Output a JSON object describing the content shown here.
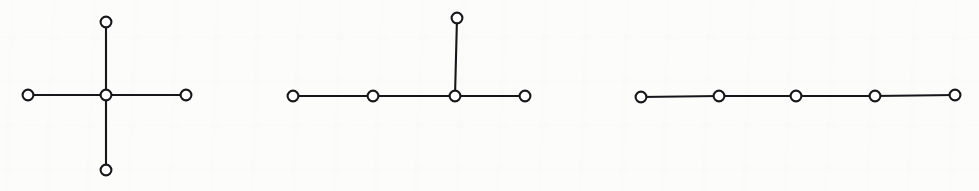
{
  "figure": {
    "name": "graph-figure-row",
    "width": 979,
    "height": 191,
    "background_color": "#fcfcfb",
    "ink_color": "#18161a",
    "node_fill_color": "#ffffff",
    "node_radius": 5.4,
    "node_stroke_width": 2.1,
    "edge_stroke_width": 2.1,
    "caption": "",
    "labels": []
  },
  "graphs": [
    {
      "name": "star-graph",
      "label": "",
      "node_count": 5,
      "edge_count": 4,
      "nodes": [
        {
          "id": "g1n0",
          "label": "",
          "x": 106,
          "y": 95
        },
        {
          "id": "g1n1",
          "label": "",
          "x": 28,
          "y": 95
        },
        {
          "id": "g1n2",
          "label": "",
          "x": 186,
          "y": 95
        },
        {
          "id": "g1n3",
          "label": "",
          "x": 106,
          "y": 22
        },
        {
          "id": "g1n4",
          "label": "",
          "x": 106,
          "y": 170
        }
      ],
      "edges": [
        {
          "from": "g1n1",
          "to": "g1n0"
        },
        {
          "from": "g1n0",
          "to": "g1n2"
        },
        {
          "from": "g1n3",
          "to": "g1n0"
        },
        {
          "from": "g1n0",
          "to": "g1n4"
        }
      ]
    },
    {
      "name": "spider-graph",
      "label": "",
      "node_count": 5,
      "edge_count": 4,
      "nodes": [
        {
          "id": "g2n0",
          "label": "",
          "x": 293,
          "y": 96
        },
        {
          "id": "g2n1",
          "label": "",
          "x": 373,
          "y": 96
        },
        {
          "id": "g2n2",
          "label": "",
          "x": 455,
          "y": 96
        },
        {
          "id": "g2n3",
          "label": "",
          "x": 525,
          "y": 96
        },
        {
          "id": "g2n4",
          "label": "",
          "x": 457,
          "y": 18
        }
      ],
      "edges": [
        {
          "from": "g2n0",
          "to": "g2n1"
        },
        {
          "from": "g2n1",
          "to": "g2n2"
        },
        {
          "from": "g2n2",
          "to": "g2n3"
        },
        {
          "from": "g2n4",
          "to": "g2n2"
        }
      ]
    },
    {
      "name": "path-graph",
      "label": "",
      "node_count": 5,
      "edge_count": 4,
      "nodes": [
        {
          "id": "g3n0",
          "label": "",
          "x": 641,
          "y": 97
        },
        {
          "id": "g3n1",
          "label": "",
          "x": 719,
          "y": 96
        },
        {
          "id": "g3n2",
          "label": "",
          "x": 796,
          "y": 96
        },
        {
          "id": "g3n3",
          "label": "",
          "x": 875,
          "y": 96
        },
        {
          "id": "g3n4",
          "label": "",
          "x": 955,
          "y": 95
        }
      ],
      "edges": [
        {
          "from": "g3n0",
          "to": "g3n1"
        },
        {
          "from": "g3n1",
          "to": "g3n2"
        },
        {
          "from": "g3n2",
          "to": "g3n3"
        },
        {
          "from": "g3n3",
          "to": "g3n4"
        }
      ]
    }
  ]
}
